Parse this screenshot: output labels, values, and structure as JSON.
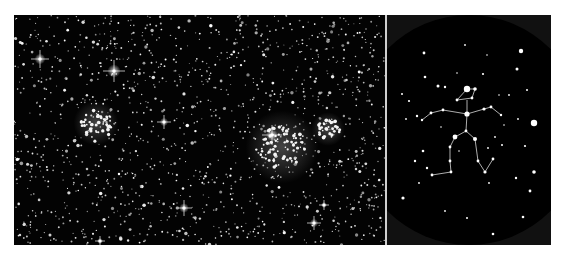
{
  "figure": {
    "panels": [
      {
        "name": "star-field-photo",
        "description": "Dense star field with two bright open clusters and several diffraction-spike stars"
      },
      {
        "name": "constellation-chart",
        "description": "Circular sky chart with stick-figure constellation outlined by lines"
      }
    ]
  },
  "colors": {
    "background": "#ffffff",
    "sky": "#000000",
    "chart_rim": "#111111",
    "star": "#ffffff",
    "line": "#dddddd",
    "divider": "#cfcfcf"
  },
  "photo": {
    "bright_stars": [
      {
        "x": 26,
        "y": 44,
        "s": 9
      },
      {
        "x": 100,
        "y": 56,
        "s": 11
      },
      {
        "x": 150,
        "y": 107,
        "s": 7
      },
      {
        "x": 258,
        "y": 120,
        "s": 10
      },
      {
        "x": 170,
        "y": 193,
        "s": 8
      },
      {
        "x": 300,
        "y": 208,
        "s": 7
      },
      {
        "x": 310,
        "y": 190,
        "s": 5
      },
      {
        "x": 86,
        "y": 226,
        "s": 5
      }
    ],
    "clusters": [
      {
        "x": 82,
        "y": 108,
        "r": 16
      },
      {
        "x": 268,
        "y": 132,
        "r": 26
      },
      {
        "x": 314,
        "y": 114,
        "r": 12
      }
    ]
  },
  "chart": {
    "circle": {
      "cx": 82,
      "cy": 115,
      "r": 115
    },
    "figure_stars": [
      {
        "x": 80,
        "y": 74,
        "r": 3.2
      },
      {
        "x": 88,
        "y": 74,
        "r": 1.8
      },
      {
        "x": 70,
        "y": 85,
        "r": 1.4
      },
      {
        "x": 85,
        "y": 83,
        "r": 1.4
      },
      {
        "x": 80,
        "y": 99,
        "r": 2.6
      },
      {
        "x": 56,
        "y": 95,
        "r": 1.4
      },
      {
        "x": 44,
        "y": 98,
        "r": 1.4
      },
      {
        "x": 35,
        "y": 105,
        "r": 1.2
      },
      {
        "x": 97,
        "y": 94,
        "r": 1.6
      },
      {
        "x": 104,
        "y": 92,
        "r": 1.4
      },
      {
        "x": 114,
        "y": 100,
        "r": 1.2
      },
      {
        "x": 79,
        "y": 116,
        "r": 1.4
      },
      {
        "x": 68,
        "y": 122,
        "r": 2.4
      },
      {
        "x": 88,
        "y": 124,
        "r": 2.0
      },
      {
        "x": 63,
        "y": 132,
        "r": 1.4
      },
      {
        "x": 63,
        "y": 146,
        "r": 1.4
      },
      {
        "x": 64,
        "y": 157,
        "r": 1.4
      },
      {
        "x": 45,
        "y": 160,
        "r": 1.4
      },
      {
        "x": 91,
        "y": 146,
        "r": 1.4
      },
      {
        "x": 98,
        "y": 157,
        "r": 1.6
      },
      {
        "x": 106,
        "y": 144,
        "r": 1.4
      }
    ],
    "lines": [
      [
        [
          70,
          85
        ],
        [
          85,
          83
        ],
        [
          88,
          74
        ],
        [
          80,
          74
        ],
        [
          70,
          85
        ]
      ],
      [
        [
          35,
          105
        ],
        [
          44,
          98
        ],
        [
          56,
          95
        ],
        [
          80,
          99
        ],
        [
          97,
          94
        ],
        [
          104,
          92
        ],
        [
          114,
          100
        ]
      ],
      [
        [
          80,
          85
        ],
        [
          80,
          99
        ],
        [
          79,
          116
        ]
      ],
      [
        [
          79,
          116
        ],
        [
          68,
          122
        ],
        [
          63,
          132
        ],
        [
          63,
          146
        ],
        [
          64,
          157
        ],
        [
          45,
          160
        ]
      ],
      [
        [
          79,
          116
        ],
        [
          88,
          124
        ],
        [
          91,
          146
        ],
        [
          98,
          157
        ],
        [
          106,
          144
        ]
      ]
    ],
    "field_stars": [
      {
        "x": 37,
        "y": 38,
        "r": 1.4
      },
      {
        "x": 78,
        "y": 30,
        "r": 0.9
      },
      {
        "x": 134,
        "y": 36,
        "r": 2.2
      },
      {
        "x": 130,
        "y": 54,
        "r": 1.5
      },
      {
        "x": 38,
        "y": 62,
        "r": 1.3
      },
      {
        "x": 96,
        "y": 59,
        "r": 1.1
      },
      {
        "x": 51,
        "y": 71,
        "r": 1.5
      },
      {
        "x": 58,
        "y": 72,
        "r": 1.2
      },
      {
        "x": 15,
        "y": 79,
        "r": 1.0
      },
      {
        "x": 22,
        "y": 86,
        "r": 1.1
      },
      {
        "x": 140,
        "y": 75,
        "r": 1.0
      },
      {
        "x": 147,
        "y": 108,
        "r": 3.2
      },
      {
        "x": 30,
        "y": 101,
        "r": 1.2
      },
      {
        "x": 19,
        "y": 104,
        "r": 0.9
      },
      {
        "x": 131,
        "y": 104,
        "r": 0.9
      },
      {
        "x": 36,
        "y": 136,
        "r": 1.3
      },
      {
        "x": 28,
        "y": 146,
        "r": 1.2
      },
      {
        "x": 40,
        "y": 153,
        "r": 1.2
      },
      {
        "x": 115,
        "y": 130,
        "r": 1.0
      },
      {
        "x": 138,
        "y": 131,
        "r": 1.1
      },
      {
        "x": 147,
        "y": 157,
        "r": 1.8
      },
      {
        "x": 129,
        "y": 163,
        "r": 1.2
      },
      {
        "x": 143,
        "y": 176,
        "r": 1.4
      },
      {
        "x": 16,
        "y": 183,
        "r": 1.6
      },
      {
        "x": 32,
        "y": 168,
        "r": 0.9
      },
      {
        "x": 58,
        "y": 196,
        "r": 0.9
      },
      {
        "x": 80,
        "y": 203,
        "r": 1.0
      },
      {
        "x": 106,
        "y": 219,
        "r": 1.3
      },
      {
        "x": 136,
        "y": 202,
        "r": 1.3
      },
      {
        "x": 102,
        "y": 168,
        "r": 0.9
      },
      {
        "x": 101,
        "y": 133,
        "r": 0.9
      },
      {
        "x": 108,
        "y": 122,
        "r": 0.9
      },
      {
        "x": 72,
        "y": 136,
        "r": 0.8
      },
      {
        "x": 117,
        "y": 110,
        "r": 0.8
      },
      {
        "x": 54,
        "y": 112,
        "r": 0.8
      },
      {
        "x": 122,
        "y": 80,
        "r": 0.9
      },
      {
        "x": 112,
        "y": 80,
        "r": 0.8
      },
      {
        "x": 70,
        "y": 58,
        "r": 0.8
      },
      {
        "x": 100,
        "y": 40,
        "r": 0.8
      }
    ]
  }
}
